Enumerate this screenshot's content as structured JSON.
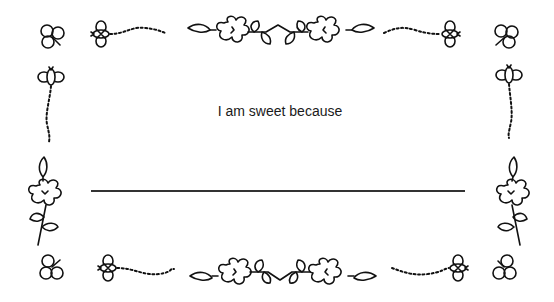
{
  "card": {
    "prompt": "I am sweet because",
    "answer_value": "",
    "line_color": "#333333"
  },
  "decorations": {
    "corners": [
      "clover-icon",
      "clover-icon",
      "clover-icon",
      "clover-icon"
    ],
    "bees": 6,
    "flower_vines": 4
  }
}
